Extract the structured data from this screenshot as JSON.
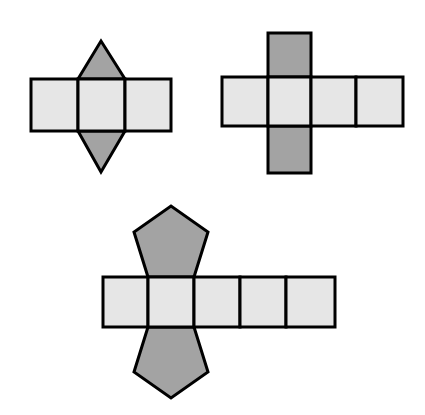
{
  "figure": {
    "title": "Polyhedron nets",
    "canvas": {
      "width": 425,
      "height": 415,
      "background": "#ffffff"
    },
    "colors": {
      "lateral_face_fill": "#e6e6e6",
      "base_face_fill": "#a3a3a3",
      "outline": "#000000",
      "outline_width": 3
    },
    "nets": [
      {
        "id": "triangular-prism-net",
        "label": "Triangular prism net",
        "position": "top-left",
        "base_polygon": "triangle",
        "base_count": 2,
        "lateral_rectangle_count": 3,
        "lateral_faces": [
          {
            "name": "lateral-face-1",
            "points": "31,79 78,79 78,131 31,131"
          },
          {
            "name": "lateral-face-2",
            "points": "78,79 125,79 125,131 78,131"
          },
          {
            "name": "lateral-face-3",
            "points": "125,79 171,79 171,131 125,131"
          }
        ],
        "base_faces": [
          {
            "name": "base-face-top",
            "points": "78,79 101,41 125,79"
          },
          {
            "name": "base-face-bottom",
            "points": "78,131 101,172 125,131"
          }
        ]
      },
      {
        "id": "cuboid-net",
        "label": "Cuboid (rectangular prism) net",
        "position": "top-right",
        "base_polygon": "square",
        "base_count": 2,
        "lateral_rectangle_count": 4,
        "lateral_faces": [
          {
            "name": "lateral-face-1",
            "points": "222,77 268,77 268,126 222,126"
          },
          {
            "name": "lateral-face-2",
            "points": "268,77 311,77 311,126 268,126"
          },
          {
            "name": "lateral-face-3",
            "points": "311,77 356,77 356,126 311,126"
          },
          {
            "name": "lateral-face-4",
            "points": "356,77 403,77 403,126 356,126"
          }
        ],
        "base_faces": [
          {
            "name": "base-face-top",
            "points": "268,33 311,33 311,77 268,77"
          },
          {
            "name": "base-face-bottom",
            "points": "268,126 311,126 311,173 268,173"
          }
        ]
      },
      {
        "id": "pentagonal-prism-net",
        "label": "Pentagonal prism net",
        "position": "bottom-center",
        "base_polygon": "pentagon",
        "base_count": 2,
        "lateral_rectangle_count": 5,
        "lateral_faces": [
          {
            "name": "lateral-face-1",
            "points": "103,277 148,277 148,327 103,327"
          },
          {
            "name": "lateral-face-2",
            "points": "148,277 194,277 194,327 148,327"
          },
          {
            "name": "lateral-face-3",
            "points": "194,277 240,277 240,327 194,327"
          },
          {
            "name": "lateral-face-4",
            "points": "240,277 286,277 286,327 240,327"
          },
          {
            "name": "lateral-face-5",
            "points": "286,277 335,277 335,327 286,327"
          }
        ],
        "base_faces": [
          {
            "name": "base-face-top",
            "points": "148,277 134,232 171,206 208,232 194,277"
          },
          {
            "name": "base-face-bottom",
            "points": "148,327 134,372 171,398 208,372 194,327"
          }
        ]
      }
    ]
  }
}
